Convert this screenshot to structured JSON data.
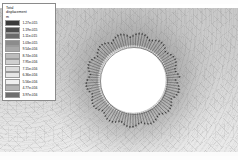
{
  "plot": {
    "type": "fea-contour-vector-plot",
    "description": "Finite element total displacement contour with radial displacement vectors around a circular hole",
    "background_color": "#cfcfcf",
    "hole_fill_color": "#ffffff",
    "arrow_color": "#2d2d2d",
    "hole": {
      "center_x": 133,
      "center_y": 80,
      "inner_radius": 33,
      "arrow_band_outer_radius": 46
    },
    "arrow_count": 96
  },
  "legend": {
    "title_line1": "Total",
    "title_line2": "displacement",
    "unit": "m",
    "border_color": "#8a8a8a",
    "background_color": "#ffffff",
    "entries": [
      {
        "value": "1.27e-015",
        "color": "#3a3a3a"
      },
      {
        "value": "1.19e-015",
        "color": "#4e4e4e"
      },
      {
        "value": "1.11e-015",
        "color": "#6b6b6b"
      },
      {
        "value": "1.03e-015",
        "color": "#8c8c8c"
      },
      {
        "value": "9.54e-016",
        "color": "#a8a8a8"
      },
      {
        "value": "8.74e-016",
        "color": "#bdbdbd"
      },
      {
        "value": "7.95e-016",
        "color": "#cfcfcf"
      },
      {
        "value": "7.15e-016",
        "color": "#dcdcdc"
      },
      {
        "value": "6.36e-016",
        "color": "#e6e6e6"
      },
      {
        "value": "5.56e-016",
        "color": "#efefef"
      },
      {
        "value": "4.77e-016",
        "color": "#b4b4b4"
      },
      {
        "value": "3.97e-016",
        "color": "#6e6e6e"
      }
    ]
  },
  "chart_data": {
    "type": "heatmap",
    "title": "Total displacement",
    "xlabel": "",
    "ylabel": "",
    "colorbar_label": "Total displacement (m)",
    "colorbar_levels": [
      1.27e-15,
      1.19e-15,
      1.11e-15,
      1.03e-15,
      9.54e-16,
      8.74e-16,
      7.95e-16,
      7.15e-16,
      6.36e-16,
      5.56e-16,
      4.77e-16,
      3.97e-16
    ],
    "colorbar_tick_labels": [
      "1.27e-015",
      "1.19e-015",
      "1.11e-015",
      "1.03e-015",
      "9.54e-016",
      "8.74e-016",
      "7.95e-016",
      "7.15e-016",
      "6.36e-016",
      "5.56e-016",
      "4.77e-016",
      "3.97e-016"
    ],
    "colormap": "grayscale",
    "grid": false,
    "legend_position": "top-left",
    "annotations": [
      "radial displacement vectors around circular hole"
    ]
  }
}
